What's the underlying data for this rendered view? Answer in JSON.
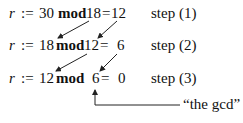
{
  "steps": [
    {
      "var": "r",
      "assign": ":=",
      "a": "30",
      "op": "mod",
      "b": "18",
      "eq": "=",
      "result": "12",
      "label": "step (1)"
    },
    {
      "var": "r",
      "assign": ":=",
      "a": "18",
      "op": "mod",
      "b": "12",
      "eq": "=",
      "result": "6",
      "label": "step (2)"
    },
    {
      "var": "r",
      "assign": ":=",
      "a": "12",
      "op": "mod",
      "b": "6",
      "eq": "=",
      "result": "0",
      "label": "step (3)"
    }
  ],
  "annotation": {
    "text": "“the gcd”",
    "points_to": "6"
  },
  "colors": {
    "text": "#111111",
    "arrow": "#222222",
    "background": "#ffffff"
  }
}
